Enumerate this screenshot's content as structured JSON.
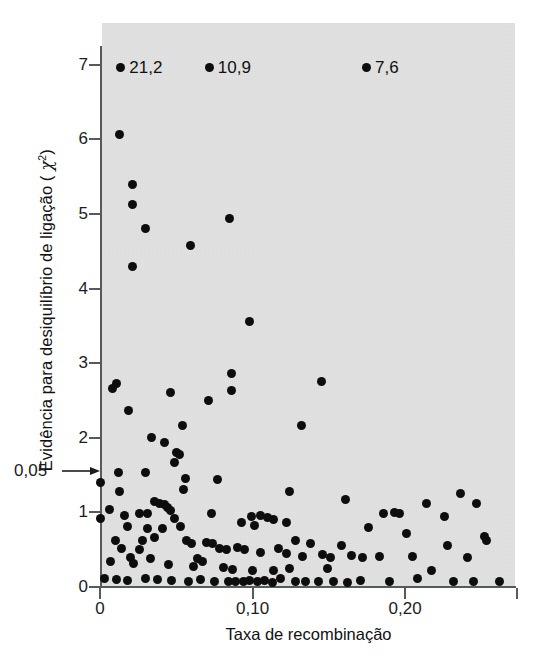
{
  "figure": {
    "background_color": "#ffffff",
    "panel_color": "#e2e2e2",
    "point_color": "#0d0d0d",
    "axis_color": "#555b5d",
    "page_artifact": ""
  },
  "annotations": {
    "threshold_label": "0,05",
    "threshold_value": 1.55,
    "arrow_icon": "right-arrow-icon"
  },
  "callouts": [
    {
      "label": "21,2",
      "x": 0.014,
      "y": 7.0
    },
    {
      "label": "10,9",
      "x": 0.072,
      "y": 7.0
    },
    {
      "label": "7,6",
      "x": 0.175,
      "y": 7.0
    }
  ],
  "chart_data": {
    "type": "scatter",
    "title": "",
    "xlabel": "Taxa de recombinação",
    "ylabel": "Evidência para desiquilíbrio de ligação (χ²)",
    "xlim": [
      0,
      0.272
    ],
    "ylim": [
      0,
      7.25
    ],
    "xticks": [
      0,
      0.1,
      0.2
    ],
    "xticklabels": [
      "0",
      "0,10",
      "0,20"
    ],
    "yticks": [
      0,
      1,
      2,
      3,
      4,
      5,
      6,
      7
    ],
    "yticklabels": [
      "0",
      "1",
      "2",
      "3",
      "4",
      "5",
      "6",
      "7"
    ],
    "grid": false,
    "legend": false,
    "marker": "filled-circle",
    "threshold_line_y": 1.55,
    "points": [
      [
        0.013,
        6.07
      ],
      [
        0.021,
        5.4
      ],
      [
        0.021,
        5.13
      ],
      [
        0.03,
        4.8
      ],
      [
        0.021,
        4.3
      ],
      [
        0.059,
        4.58
      ],
      [
        0.085,
        4.94
      ],
      [
        0.098,
        3.56
      ],
      [
        0.086,
        2.86
      ],
      [
        0.086,
        2.63
      ],
      [
        0.011,
        2.73
      ],
      [
        0.008,
        2.66
      ],
      [
        0.046,
        2.6
      ],
      [
        0.071,
        2.5
      ],
      [
        0.145,
        2.76
      ],
      [
        0.019,
        2.36
      ],
      [
        0.054,
        2.17
      ],
      [
        0.132,
        2.16
      ],
      [
        0.034,
        2.0
      ],
      [
        0.042,
        1.93
      ],
      [
        0.05,
        1.8
      ],
      [
        0.052,
        1.77
      ],
      [
        0.049,
        1.67
      ],
      [
        0.012,
        1.54
      ],
      [
        0.03,
        1.53
      ],
      [
        0.0,
        1.4
      ],
      [
        0.056,
        1.45
      ],
      [
        0.077,
        1.44
      ],
      [
        0.055,
        1.3
      ],
      [
        0.013,
        1.28
      ],
      [
        0.124,
        1.28
      ],
      [
        0.161,
        1.17
      ],
      [
        0.214,
        1.12
      ],
      [
        0.036,
        1.15
      ],
      [
        0.039,
        1.12
      ],
      [
        0.042,
        1.1
      ],
      [
        0.044,
        1.06
      ],
      [
        0.046,
        1.03
      ],
      [
        0.236,
        1.25
      ],
      [
        0.247,
        1.12
      ],
      [
        0.006,
        1.04
      ],
      [
        0.0,
        0.92
      ],
      [
        0.016,
        0.96
      ],
      [
        0.026,
        0.98
      ],
      [
        0.031,
        0.99
      ],
      [
        0.049,
        0.92
      ],
      [
        0.073,
        0.98
      ],
      [
        0.099,
        0.95
      ],
      [
        0.105,
        0.96
      ],
      [
        0.11,
        0.93
      ],
      [
        0.114,
        0.9
      ],
      [
        0.093,
        0.86
      ],
      [
        0.101,
        0.83
      ],
      [
        0.122,
        0.86
      ],
      [
        0.186,
        0.98
      ],
      [
        0.196,
        0.99
      ],
      [
        0.193,
        1.0
      ],
      [
        0.226,
        0.95
      ],
      [
        0.018,
        0.81
      ],
      [
        0.031,
        0.78
      ],
      [
        0.041,
        0.79
      ],
      [
        0.053,
        0.81
      ],
      [
        0.176,
        0.8
      ],
      [
        0.201,
        0.72
      ],
      [
        0.252,
        0.68
      ],
      [
        0.253,
        0.62
      ],
      [
        0.01,
        0.62
      ],
      [
        0.028,
        0.62
      ],
      [
        0.036,
        0.66
      ],
      [
        0.057,
        0.62
      ],
      [
        0.06,
        0.58
      ],
      [
        0.07,
        0.6
      ],
      [
        0.074,
        0.58
      ],
      [
        0.128,
        0.62
      ],
      [
        0.138,
        0.58
      ],
      [
        0.158,
        0.56
      ],
      [
        0.228,
        0.55
      ],
      [
        0.014,
        0.52
      ],
      [
        0.026,
        0.5
      ],
      [
        0.078,
        0.52
      ],
      [
        0.083,
        0.5
      ],
      [
        0.09,
        0.53
      ],
      [
        0.095,
        0.5
      ],
      [
        0.117,
        0.52
      ],
      [
        0.105,
        0.46
      ],
      [
        0.122,
        0.45
      ],
      [
        0.133,
        0.41
      ],
      [
        0.146,
        0.44
      ],
      [
        0.151,
        0.4
      ],
      [
        0.165,
        0.42
      ],
      [
        0.172,
        0.4
      ],
      [
        0.183,
        0.41
      ],
      [
        0.205,
        0.41
      ],
      [
        0.241,
        0.4
      ],
      [
        0.02,
        0.4
      ],
      [
        0.033,
        0.38
      ],
      [
        0.064,
        0.38
      ],
      [
        0.067,
        0.34
      ],
      [
        0.007,
        0.34
      ],
      [
        0.022,
        0.32
      ],
      [
        0.045,
        0.3
      ],
      [
        0.061,
        0.27
      ],
      [
        0.081,
        0.26
      ],
      [
        0.087,
        0.24
      ],
      [
        0.1,
        0.22
      ],
      [
        0.114,
        0.22
      ],
      [
        0.124,
        0.25
      ],
      [
        0.149,
        0.25
      ],
      [
        0.217,
        0.22
      ],
      [
        0.003,
        0.11
      ],
      [
        0.011,
        0.1
      ],
      [
        0.018,
        0.09
      ],
      [
        0.03,
        0.11
      ],
      [
        0.038,
        0.1
      ],
      [
        0.047,
        0.09
      ],
      [
        0.058,
        0.08
      ],
      [
        0.066,
        0.1
      ],
      [
        0.075,
        0.08
      ],
      [
        0.084,
        0.07
      ],
      [
        0.089,
        0.08
      ],
      [
        0.094,
        0.07
      ],
      [
        0.098,
        0.09
      ],
      [
        0.103,
        0.07
      ],
      [
        0.108,
        0.09
      ],
      [
        0.113,
        0.06
      ],
      [
        0.118,
        0.12
      ],
      [
        0.128,
        0.08
      ],
      [
        0.135,
        0.07
      ],
      [
        0.143,
        0.08
      ],
      [
        0.153,
        0.07
      ],
      [
        0.162,
        0.06
      ],
      [
        0.171,
        0.09
      ],
      [
        0.19,
        0.07
      ],
      [
        0.208,
        0.12
      ],
      [
        0.232,
        0.08
      ],
      [
        0.245,
        0.07
      ],
      [
        0.262,
        0.08
      ]
    ]
  }
}
